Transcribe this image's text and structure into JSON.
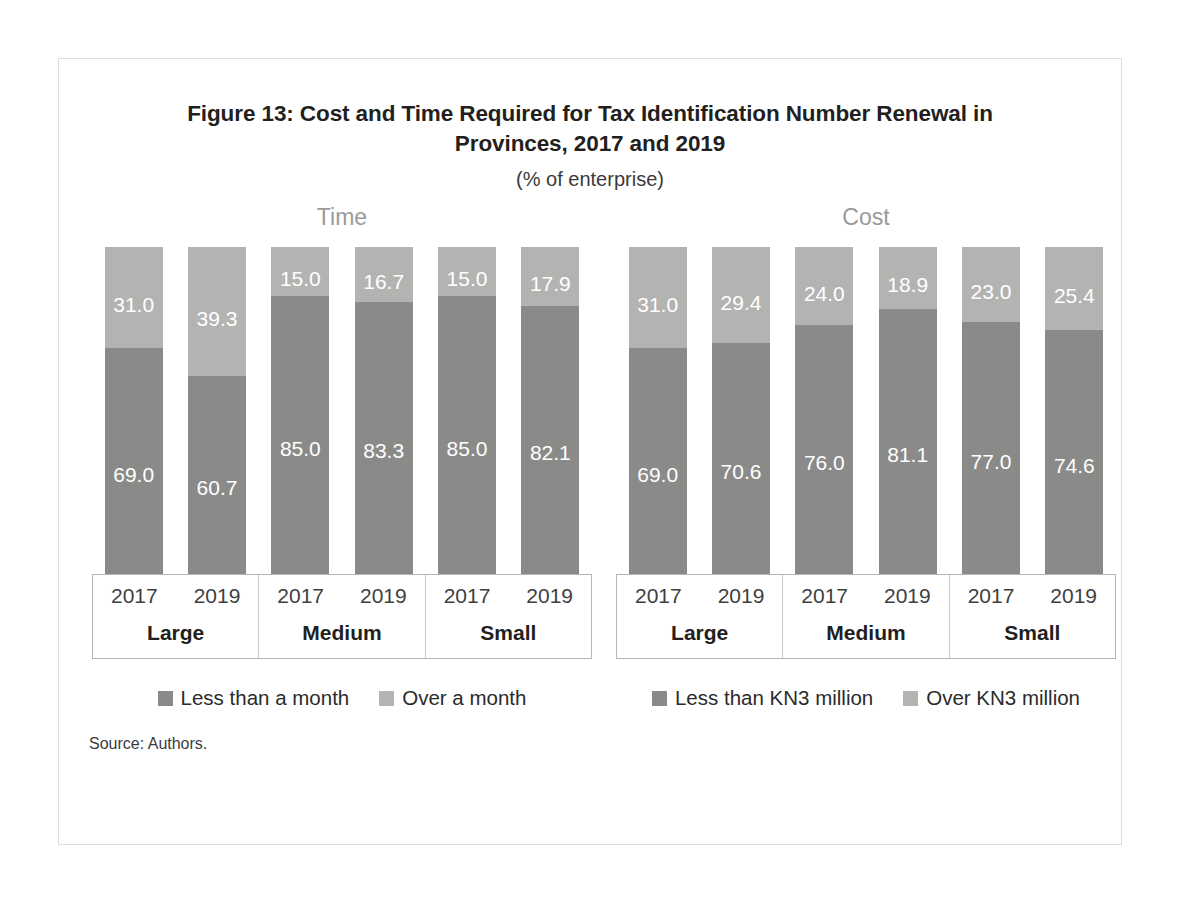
{
  "figure": {
    "title": "Figure 13: Cost and Time Required for Tax Identification Number Renewal in Provinces, 2017 and 2019",
    "subtitle": "(% of enterprise)",
    "source": "Source: Authors."
  },
  "colors": {
    "segment_bottom": "#8a8b89",
    "segment_top": "#b3b4b2",
    "frame_border": "#dcdcdc",
    "axis_border": "#b5b5b5",
    "panel_heading": "#9a9a9a"
  },
  "chart_data": [
    {
      "type": "bar",
      "title": "Time",
      "subtype": "stacked-100",
      "xlabel": "",
      "ylabel": "",
      "ylim": [
        0,
        100
      ],
      "grid": false,
      "legend_position": "bottom",
      "groups": [
        "Large",
        "Medium",
        "Small"
      ],
      "categories": [
        "2017",
        "2019",
        "2017",
        "2019",
        "2017",
        "2019"
      ],
      "series": [
        {
          "name": "Less than a month",
          "color": "#8a8b89",
          "values": [
            69.0,
            60.7,
            85.0,
            83.3,
            85.0,
            82.1
          ]
        },
        {
          "name": "Over a month",
          "color": "#b3b4b2",
          "values": [
            31.0,
            39.3,
            15.0,
            16.7,
            15.0,
            17.9
          ]
        }
      ]
    },
    {
      "type": "bar",
      "title": "Cost",
      "subtype": "stacked-100",
      "xlabel": "",
      "ylabel": "",
      "ylim": [
        0,
        100
      ],
      "grid": false,
      "legend_position": "bottom",
      "groups": [
        "Large",
        "Medium",
        "Small"
      ],
      "categories": [
        "2017",
        "2019",
        "2017",
        "2019",
        "2017",
        "2019"
      ],
      "series": [
        {
          "name": "Less than KN3 million",
          "color": "#8a8b89",
          "values": [
            69.0,
            70.6,
            76.0,
            81.1,
            77.0,
            74.6
          ]
        },
        {
          "name": "Over KN3 million",
          "color": "#b3b4b2",
          "values": [
            31.0,
            29.4,
            24.0,
            18.9,
            23.0,
            25.4
          ]
        }
      ]
    }
  ],
  "panels": {
    "time": {
      "heading": "Time",
      "bars": [
        {
          "top_label": "31.0",
          "top_value": 31.0,
          "bottom_label": "69.0",
          "bottom_value": 69.0
        },
        {
          "top_label": "39.3",
          "top_value": 39.3,
          "bottom_label": "60.7",
          "bottom_value": 60.7
        },
        {
          "top_label": "15.0",
          "top_value": 15.0,
          "bottom_label": "85.0",
          "bottom_value": 85.0
        },
        {
          "top_label": "16.7",
          "top_value": 16.7,
          "bottom_label": "83.3",
          "bottom_value": 83.3
        },
        {
          "top_label": "15.0",
          "top_value": 15.0,
          "bottom_label": "85.0",
          "bottom_value": 85.0
        },
        {
          "top_label": "17.9",
          "top_value": 17.9,
          "bottom_label": "82.1",
          "bottom_value": 82.1
        }
      ],
      "axis": {
        "groups": [
          {
            "size": "Large",
            "years": [
              "2017",
              "2019"
            ]
          },
          {
            "size": "Medium",
            "years": [
              "2017",
              "2019"
            ]
          },
          {
            "size": "Small",
            "years": [
              "2017",
              "2019"
            ]
          }
        ]
      },
      "legend": [
        {
          "label": "Less than a month",
          "color": "#8a8b89"
        },
        {
          "label": "Over a month",
          "color": "#b3b4b2"
        }
      ]
    },
    "cost": {
      "heading": "Cost",
      "bars": [
        {
          "top_label": "31.0",
          "top_value": 31.0,
          "bottom_label": "69.0",
          "bottom_value": 69.0
        },
        {
          "top_label": "29.4",
          "top_value": 29.4,
          "bottom_label": "70.6",
          "bottom_value": 70.6
        },
        {
          "top_label": "24.0",
          "top_value": 24.0,
          "bottom_label": "76.0",
          "bottom_value": 76.0
        },
        {
          "top_label": "18.9",
          "top_value": 18.9,
          "bottom_label": "81.1",
          "bottom_value": 81.1
        },
        {
          "top_label": "23.0",
          "top_value": 23.0,
          "bottom_label": "77.0",
          "bottom_value": 77.0
        },
        {
          "top_label": "25.4",
          "top_value": 25.4,
          "bottom_label": "74.6",
          "bottom_value": 74.6
        }
      ],
      "axis": {
        "groups": [
          {
            "size": "Large",
            "years": [
              "2017",
              "2019"
            ]
          },
          {
            "size": "Medium",
            "years": [
              "2017",
              "2019"
            ]
          },
          {
            "size": "Small",
            "years": [
              "2017",
              "2019"
            ]
          }
        ]
      },
      "legend": [
        {
          "label": "Less than KN3 million",
          "color": "#8a8b89"
        },
        {
          "label": "Over KN3 million",
          "color": "#b3b4b2"
        }
      ]
    }
  }
}
